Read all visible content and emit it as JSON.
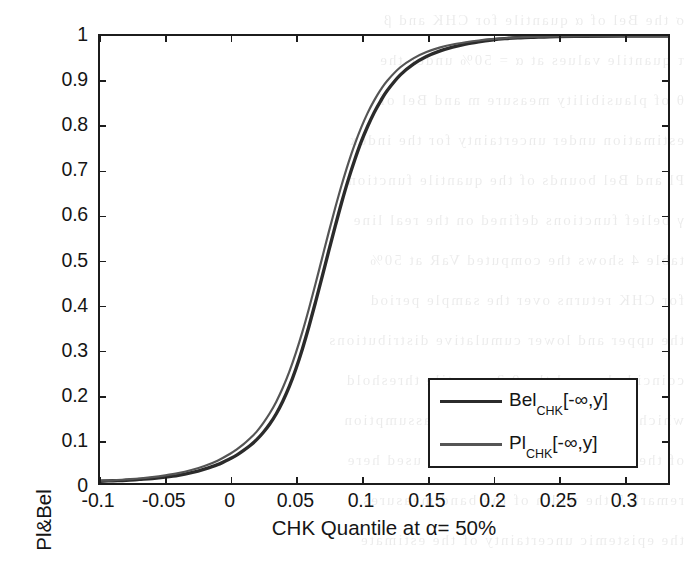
{
  "figure": {
    "kind": "matlab-line-plot",
    "background": "#ffffff",
    "axis_color": "#1c1c1c"
  },
  "chart_data": {
    "type": "line",
    "title": "",
    "xlabel": "CHK Quantile at α= 50%",
    "ylabel": "Pl&Bel",
    "xlim": [
      -0.1,
      0.335
    ],
    "ylim": [
      0,
      1
    ],
    "grid": false,
    "xticks": [
      -0.1,
      -0.05,
      0,
      0.05,
      0.1,
      0.15,
      0.2,
      0.25,
      0.3
    ],
    "xticklabels": [
      "-0.1",
      "-0.05",
      "0",
      "0.05",
      "0.1",
      "0.15",
      "0.2",
      "0.25",
      "0.3"
    ],
    "yticks": [
      0,
      0.1,
      0.2,
      0.3,
      0.4,
      0.5,
      0.6,
      0.7,
      0.8,
      0.9,
      1
    ],
    "yticklabels": [
      "0",
      "0.1",
      "0.2",
      "0.3",
      "0.4",
      "0.5",
      "0.6",
      "0.7",
      "0.8",
      "0.9",
      "1"
    ],
    "legend_position": "lower right",
    "series": [
      {
        "name": "Bel_CHK[-∞,y]",
        "label_base": "Bel",
        "label_sub": "CHK",
        "label_bracket": "[-∞,y]",
        "color": "#2b2b2b",
        "linewidth": 3.4,
        "x": [
          -0.1,
          -0.09,
          -0.08,
          -0.07,
          -0.06,
          -0.05,
          -0.04,
          -0.03,
          -0.02,
          -0.01,
          0.0,
          0.005,
          0.01,
          0.015,
          0.02,
          0.025,
          0.03,
          0.035,
          0.04,
          0.045,
          0.05,
          0.055,
          0.06,
          0.065,
          0.07,
          0.075,
          0.08,
          0.085,
          0.09,
          0.095,
          0.1,
          0.105,
          0.11,
          0.115,
          0.12,
          0.13,
          0.14,
          0.15,
          0.16,
          0.17,
          0.18,
          0.19,
          0.2,
          0.21,
          0.22,
          0.23,
          0.25,
          0.27,
          0.3,
          0.335
        ],
        "y": [
          0.004,
          0.005,
          0.006,
          0.008,
          0.01,
          0.013,
          0.017,
          0.023,
          0.031,
          0.041,
          0.055,
          0.063,
          0.073,
          0.084,
          0.097,
          0.113,
          0.132,
          0.155,
          0.183,
          0.216,
          0.255,
          0.3,
          0.35,
          0.404,
          0.46,
          0.517,
          0.573,
          0.627,
          0.677,
          0.722,
          0.763,
          0.798,
          0.829,
          0.855,
          0.878,
          0.913,
          0.937,
          0.954,
          0.966,
          0.975,
          0.982,
          0.987,
          0.991,
          0.994,
          0.996,
          0.997,
          0.999,
          0.9995,
          1.0,
          1.0
        ]
      },
      {
        "name": "Pl_CHK[-∞,y]",
        "label_base": "Pl",
        "label_sub": "CHK",
        "label_bracket": "[-∞,y]",
        "color": "#555555",
        "linewidth": 2.2,
        "x": [
          -0.1,
          -0.09,
          -0.08,
          -0.07,
          -0.06,
          -0.05,
          -0.04,
          -0.03,
          -0.02,
          -0.01,
          0.0,
          0.005,
          0.01,
          0.015,
          0.02,
          0.025,
          0.03,
          0.035,
          0.04,
          0.045,
          0.05,
          0.055,
          0.06,
          0.065,
          0.07,
          0.075,
          0.08,
          0.085,
          0.09,
          0.095,
          0.1,
          0.105,
          0.11,
          0.115,
          0.12,
          0.13,
          0.14,
          0.15,
          0.16,
          0.17,
          0.18,
          0.19,
          0.2,
          0.21,
          0.22,
          0.23,
          0.25,
          0.27,
          0.3,
          0.335
        ],
        "y": [
          0.005,
          0.006,
          0.008,
          0.01,
          0.013,
          0.017,
          0.022,
          0.029,
          0.038,
          0.05,
          0.066,
          0.076,
          0.087,
          0.1,
          0.115,
          0.134,
          0.156,
          0.182,
          0.213,
          0.249,
          0.291,
          0.338,
          0.39,
          0.445,
          0.502,
          0.559,
          0.614,
          0.666,
          0.714,
          0.757,
          0.795,
          0.828,
          0.856,
          0.88,
          0.9,
          0.93,
          0.95,
          0.964,
          0.974,
          0.981,
          0.986,
          0.99,
          0.993,
          0.995,
          0.997,
          0.998,
          0.999,
          0.9996,
          1.0,
          1.0
        ]
      }
    ]
  },
  "bleed_lines": [
    "σ  the  Bel  of  α  quantile   for  CHK  and  β",
    "τ  quantile  values   at  α = 50%  under  the",
    "θ  of  plausibility  measure  m  and  Bel  of",
    "estimation  under  uncertainty  for  the  index",
    "Pl  and  Bel  bounds  of  the  quantile  function",
    "γ  belief  functions  defined  on  the  real  line",
    "table  4  shows  the  computed  VaR  at  50%",
    "for  CHK  returns  over  the  sample  period",
    "the  upper  and  lower  cumulative  distributions",
    "coincide  beyond  the  0.2  quantile  threshold",
    "which  confirms  the  consonance  assumption",
    "of  the  random  set  representation  used  here",
    "remark  5  the  width  of  the  band  measures",
    "the  epistemic  uncertainty  of  the  estimate"
  ]
}
